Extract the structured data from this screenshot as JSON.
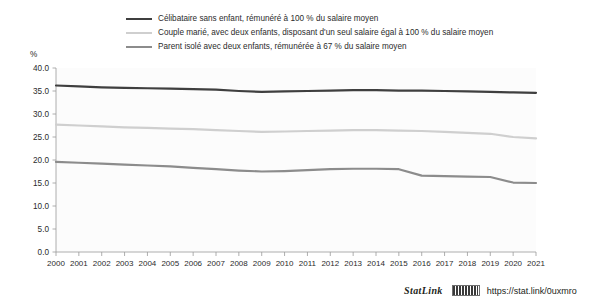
{
  "axis_unit_label": "%",
  "legend": [
    {
      "label": "Célibataire sans enfant, rémunéré à 100 % du salaire moyen",
      "color": "#3f3f3f",
      "name": "legend-item-celibataire"
    },
    {
      "label": "Couple marié, avec deux enfants, disposant d'un seul salaire égal à 100 % du salaire moyen",
      "color": "#cfcfcf",
      "name": "legend-item-couple-marie"
    },
    {
      "label": "Parent isolé avec deux enfants, rémunérée à 67 % du salaire moyen",
      "color": "#8c8c8c",
      "name": "legend-item-parent-isole"
    }
  ],
  "statlink": {
    "word": "StatLink",
    "url": "https://stat.link/0uxmro"
  },
  "chart_data": {
    "type": "line",
    "title": "",
    "subtitle": "",
    "xlabel": "",
    "ylabel": "%",
    "ylim": [
      0.0,
      40.0
    ],
    "ytick_step": 5.0,
    "ytick_labels": [
      "0.0",
      "5.0",
      "10.0",
      "15.0",
      "20.0",
      "25.0",
      "30.0",
      "35.0",
      "40.0"
    ],
    "grid": false,
    "legend_position": "top",
    "x": [
      2000,
      2001,
      2002,
      2003,
      2004,
      2005,
      2006,
      2007,
      2008,
      2009,
      2010,
      2011,
      2012,
      2013,
      2014,
      2015,
      2016,
      2017,
      2018,
      2019,
      2020,
      2021
    ],
    "categories": [
      "2000",
      "2001",
      "2002",
      "2003",
      "2004",
      "2005",
      "2006",
      "2007",
      "2008",
      "2009",
      "2010",
      "2011",
      "2012",
      "2013",
      "2014",
      "2015",
      "2016",
      "2017",
      "2018",
      "2019",
      "2020",
      "2021"
    ],
    "series": [
      {
        "name": "Célibataire sans enfant, rémunéré à 100 % du salaire moyen",
        "color": "#3f3f3f",
        "width": 2.2,
        "values": [
          36.2,
          36.0,
          35.8,
          35.7,
          35.6,
          35.5,
          35.4,
          35.3,
          35.0,
          34.8,
          34.9,
          35.0,
          35.1,
          35.2,
          35.2,
          35.1,
          35.1,
          35.0,
          34.9,
          34.8,
          34.7,
          34.6
        ]
      },
      {
        "name": "Couple marié, avec deux enfants, disposant d'un seul salaire égal à 100 % du salaire moyen",
        "color": "#cfcfcf",
        "width": 2.2,
        "values": [
          27.7,
          27.5,
          27.3,
          27.1,
          27.0,
          26.8,
          26.7,
          26.5,
          26.3,
          26.1,
          26.2,
          26.3,
          26.4,
          26.5,
          26.5,
          26.4,
          26.3,
          26.1,
          25.9,
          25.7,
          25.0,
          24.7
        ]
      },
      {
        "name": "Parent isolé avec deux enfants, rémunérée à 67 % du salaire moyen",
        "color": "#8c8c8c",
        "width": 2.2,
        "values": [
          19.6,
          19.4,
          19.2,
          19.0,
          18.8,
          18.6,
          18.3,
          18.0,
          17.7,
          17.5,
          17.6,
          17.8,
          18.0,
          18.1,
          18.1,
          18.0,
          16.6,
          16.5,
          16.4,
          16.3,
          15.1,
          15.0
        ]
      }
    ]
  }
}
